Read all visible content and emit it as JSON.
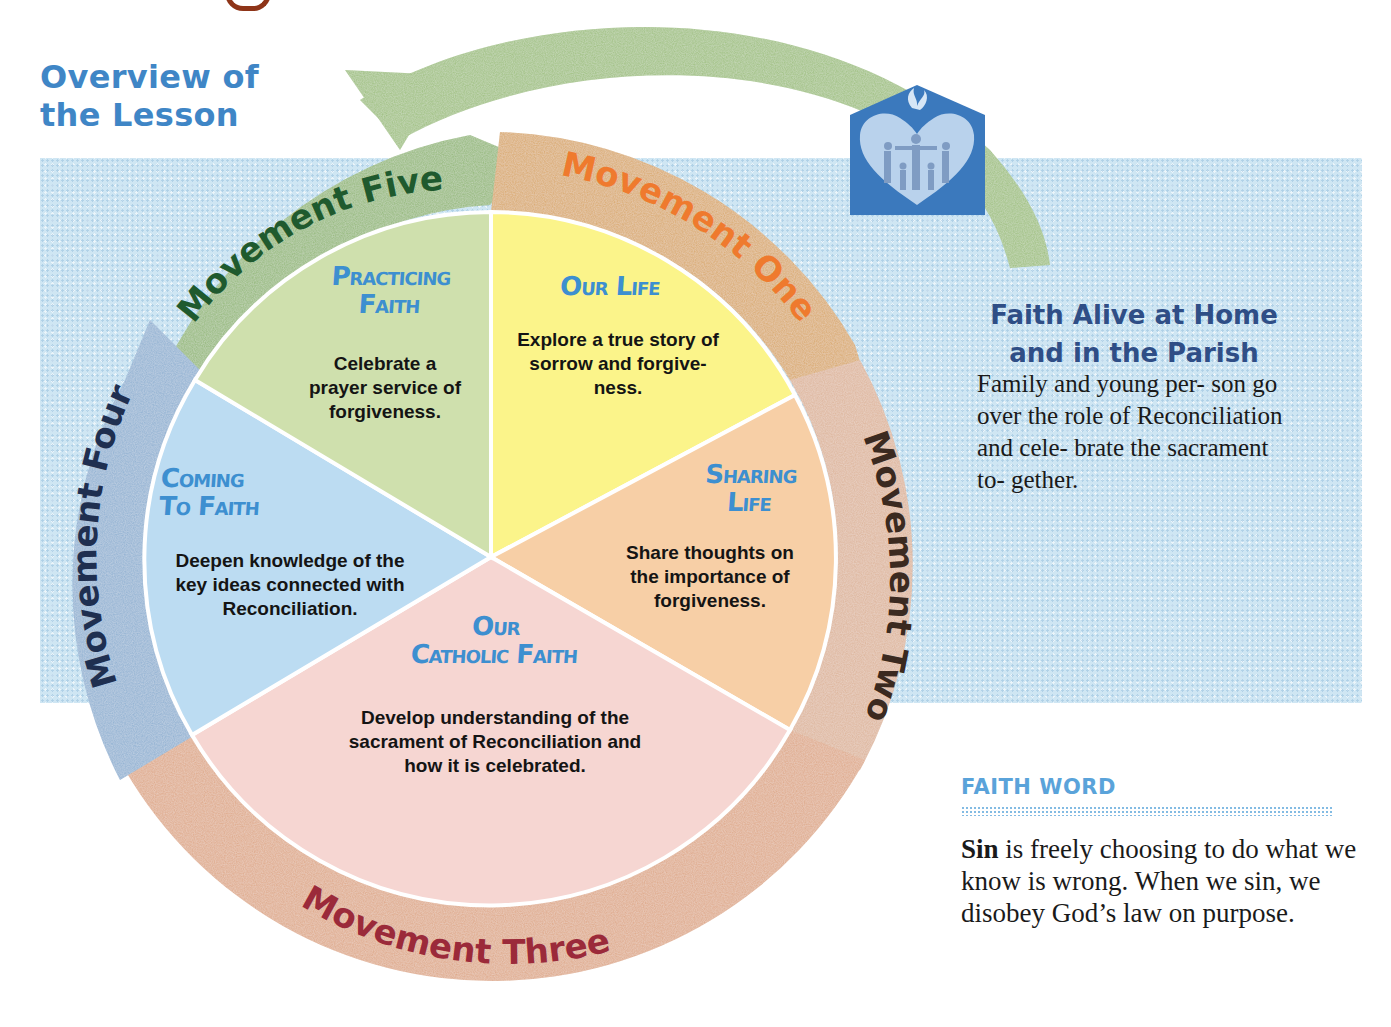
{
  "header": {
    "title_line1": "Overview of",
    "title_line2": "the Lesson"
  },
  "colors": {
    "title_blue": "#3f86c6",
    "band_blue": "#cfe6f3",
    "slice_title_blue": "#3d8fd0",
    "aside_head_navy": "#2f4e86",
    "faith_word_blue": "#5aa3da",
    "logo_blue": "#3b79bd"
  },
  "movements": [
    {
      "id": "one",
      "label": "Movement One",
      "ring_color": "#d9a86a",
      "text_color": "#ef7a2e"
    },
    {
      "id": "two",
      "label": "Movement Two",
      "ring_color": "#ddb49a",
      "text_color": "#3b2a20"
    },
    {
      "id": "three",
      "label": "Movement Three",
      "ring_color": "#dea888",
      "text_color": "#9b2a3a"
    },
    {
      "id": "four",
      "label": "Movement Four",
      "ring_color": "#8fb0d2",
      "text_color": "#1f2f50"
    },
    {
      "id": "five",
      "label": "Movement Five",
      "ring_color": "#93b878",
      "text_color": "#1f5a2e"
    }
  ],
  "slices": [
    {
      "id": "our-life",
      "title_line1": "Our Life",
      "title_line2": "",
      "description_lines": [
        "Explore a true story of",
        "sorrow and forgive-",
        "ness."
      ],
      "color": "#fbf48a"
    },
    {
      "id": "sharing-life",
      "title_line1": "Sharing",
      "title_line2": "Life",
      "description_lines": [
        "Share thoughts on",
        "the importance of",
        "forgiveness."
      ],
      "color": "#f7cfa6"
    },
    {
      "id": "our-catholic-faith",
      "title_line1": "Our",
      "title_line2": "Catholic Faith",
      "description_lines": [
        "Develop understanding of the",
        "sacrament of Reconciliation and",
        "how it is celebrated."
      ],
      "color": "#f6d6d2"
    },
    {
      "id": "coming-to-faith",
      "title_line1": "Coming",
      "title_line2": "To Faith",
      "description_lines": [
        "Deepen knowledge of the",
        "key ideas connected with",
        "Reconciliation."
      ],
      "color": "#bcdcf2"
    },
    {
      "id": "practicing-faith",
      "title_line1": "Practicing",
      "title_line2": "Faith",
      "description_lines": [
        "Celebrate a",
        "prayer service of",
        "forgiveness."
      ],
      "color": "#cfe0ad"
    }
  ],
  "logo": {
    "icon": "home-heart-family-dove-icon"
  },
  "aside": {
    "heading_line1": "Faith Alive at Home",
    "heading_line2": "and in the Parish",
    "body": "Family and young per- son go over the role of Reconciliation and cele- brate the sacrament to- gether."
  },
  "faith_word": {
    "label": "FAITH WORD",
    "term": "Sin",
    "definition": " is freely choosing to do what we know is wrong. When we sin, we disobey God’s law on purpose."
  }
}
